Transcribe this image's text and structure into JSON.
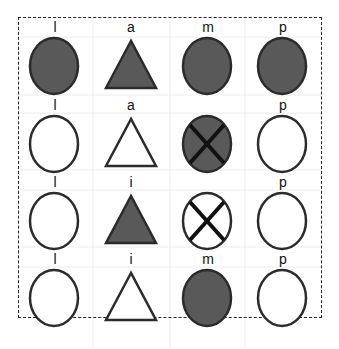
{
  "diagram": {
    "columns": [
      "l",
      "a/i",
      "m",
      "p"
    ],
    "colors": {
      "filled": "#595959",
      "stroke": "#2b2b2b",
      "empty": "#ffffff",
      "cross": "#111111",
      "border": "#222222"
    },
    "rows": [
      {
        "cells": [
          {
            "label": "l",
            "shape": "circle",
            "filled": true,
            "crossed": false
          },
          {
            "label": "a",
            "shape": "triangle",
            "filled": true,
            "crossed": false
          },
          {
            "label": "m",
            "shape": "circle",
            "filled": true,
            "crossed": false
          },
          {
            "label": "p",
            "shape": "circle",
            "filled": true,
            "crossed": false
          }
        ]
      },
      {
        "cells": [
          {
            "label": "l",
            "shape": "circle",
            "filled": false,
            "crossed": false
          },
          {
            "label": "a",
            "shape": "triangle",
            "filled": false,
            "crossed": false
          },
          {
            "label": "",
            "shape": "circle",
            "filled": true,
            "crossed": true
          },
          {
            "label": "p",
            "shape": "circle",
            "filled": false,
            "crossed": false
          }
        ]
      },
      {
        "cells": [
          {
            "label": "l",
            "shape": "circle",
            "filled": false,
            "crossed": false
          },
          {
            "label": "i",
            "shape": "triangle",
            "filled": true,
            "crossed": false
          },
          {
            "label": "",
            "shape": "circle",
            "filled": false,
            "crossed": true
          },
          {
            "label": "p",
            "shape": "circle",
            "filled": false,
            "crossed": false
          }
        ]
      },
      {
        "cells": [
          {
            "label": "l",
            "shape": "circle",
            "filled": false,
            "crossed": false
          },
          {
            "label": "i",
            "shape": "triangle",
            "filled": false,
            "crossed": false
          },
          {
            "label": "m",
            "shape": "circle",
            "filled": true,
            "crossed": false
          },
          {
            "label": "p",
            "shape": "circle",
            "filled": false,
            "crossed": false
          }
        ]
      }
    ]
  }
}
